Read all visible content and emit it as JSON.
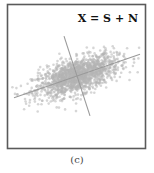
{
  "chart_data": {
    "type": "scatter",
    "title": "",
    "xlabel": "",
    "ylabel": "",
    "grid": false,
    "annotation": "X = S + N",
    "annotation_position": "top-right",
    "caption": "(c)",
    "distribution": {
      "kind": "bivariate-gaussian-cloud",
      "center": [
        0,
        0
      ],
      "major_axis_angle_deg": 19,
      "major_std": 1.0,
      "minor_std": 0.38,
      "n_points": 1500
    },
    "principal_axes": [
      {
        "name": "major",
        "angle_deg": 19,
        "half_length": 3.1
      },
      {
        "name": "minor",
        "angle_deg": 108,
        "half_length": 1.95
      }
    ],
    "xlim": [
      -3.3,
      3.3
    ],
    "ylim": [
      -3.3,
      3.3
    ],
    "colors": {
      "points": "#b4b4b4",
      "axes": "#9a9a9a",
      "frame": "#5a5a5a",
      "annotation": "#111111"
    }
  }
}
